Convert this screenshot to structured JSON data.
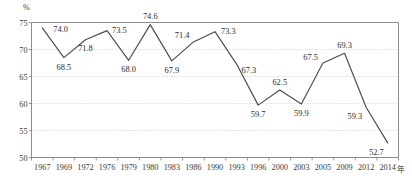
{
  "chart_data": {
    "type": "line",
    "title": "",
    "xlabel": "年",
    "ylabel": "%",
    "categories": [
      "1967",
      "1969",
      "1972",
      "1976",
      "1979",
      "1980",
      "1983",
      "1986",
      "1990",
      "1993",
      "1996",
      "2000",
      "2003",
      "2005",
      "2009",
      "2012",
      "2014"
    ],
    "values": [
      74.0,
      68.5,
      71.8,
      73.5,
      68.0,
      74.6,
      67.9,
      71.4,
      73.3,
      67.3,
      59.7,
      62.5,
      59.9,
      67.5,
      69.3,
      59.3,
      52.7
    ],
    "point_labels": [
      "74.0",
      "68.5",
      "71.8",
      "73.5",
      "68.0",
      "74.6",
      "67.9",
      "71.4",
      "73.3",
      "67.3",
      "59.7",
      "62.5",
      "59.9",
      "67.5",
      "69.3",
      "59.3",
      "52.7"
    ],
    "label_positions": [
      "above",
      "below",
      "below",
      "above",
      "below",
      "above",
      "below",
      "above",
      "above",
      "below",
      "below",
      "above",
      "below",
      "above",
      "above",
      "below",
      "below"
    ],
    "ylim": [
      50,
      75
    ],
    "yticks": [
      50,
      55,
      60,
      65,
      70,
      75
    ],
    "ytick_labels": [
      "50",
      "55",
      "60",
      "65",
      "70",
      "75"
    ],
    "grid": true,
    "legend": "none",
    "series_color": "#4a4a4a",
    "grid_color": "#c8c8c8",
    "axis_color": "#808080",
    "text_color": "#3a3a3a"
  },
  "axes": {
    "y_unit": "%",
    "x_unit": "年"
  }
}
